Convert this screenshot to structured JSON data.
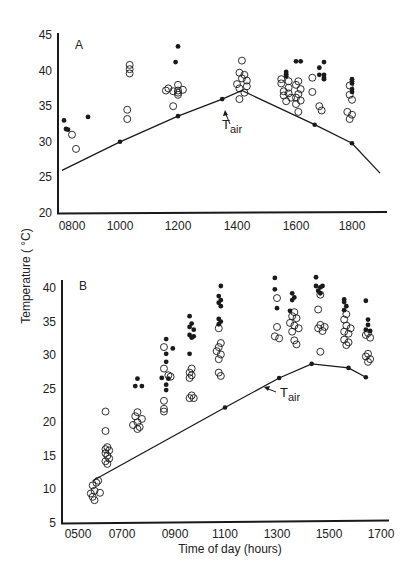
{
  "figure": {
    "ylabel": "Temperature ( °C)",
    "xlabel": "Time of day (hours)"
  },
  "chart_data": [
    {
      "type": "scatter",
      "panel": "A",
      "xlabel": "",
      "ylabel": "Temperature ( °C)",
      "ylim": [
        20,
        45
      ],
      "xlim": [
        730,
        1900
      ],
      "yticks": [
        20,
        25,
        30,
        35,
        40,
        45
      ],
      "xticks": [
        "0800",
        "1000",
        "1200",
        "1400",
        "1600",
        "1800"
      ],
      "grid": false,
      "annotation": "Tair",
      "series": [
        {
          "name": "Tair",
          "style": "line-with-dots",
          "points": [
            [
              735,
              26.0
            ],
            [
              1000,
              30.0,
              "dot"
            ],
            [
              1200,
              33.6,
              "dot"
            ],
            [
              1330,
              36.0,
              "dot"
            ],
            [
              1410,
              37.2
            ],
            [
              1640,
              32.4,
              "dot"
            ],
            [
              1760,
              29.8,
              "dot"
            ],
            [
              1860,
              25.6
            ]
          ]
        },
        {
          "name": "filled",
          "marker": "filled-circle",
          "points": [
            [
              740,
              33.0
            ],
            [
              745,
              31.8
            ],
            [
              750,
              31.7
            ],
            [
              840,
              33.5
            ],
            [
              1160,
              43.4
            ],
            [
              1155,
              41.2
            ],
            [
              1540,
              39.8
            ],
            [
              1540,
              39.5
            ],
            [
              1540,
              39.2
            ],
            [
              1600,
              41.3
            ],
            [
              1610,
              41.3
            ],
            [
              1650,
              40.4
            ],
            [
              1650,
              39.4
            ],
            [
              1700,
              41.2
            ],
            [
              1700,
              39.4
            ],
            [
              1700,
              39.0
            ],
            [
              1700,
              38.8
            ],
            [
              1760,
              38.8
            ],
            [
              1760,
              38.5
            ],
            [
              1760,
              38.2
            ],
            [
              1760,
              37.4
            ],
            [
              1760,
              37.0
            ]
          ]
        },
        {
          "name": "open",
          "marker": "open-circle",
          "points": [
            [
              760,
              31.0
            ],
            [
              770,
              29.0
            ],
            [
              1020,
              40.8
            ],
            [
              1020,
              40.2
            ],
            [
              1020,
              39.6
            ],
            [
              1015,
              34.5
            ],
            [
              1015,
              33.2
            ],
            [
              1160,
              38.0
            ],
            [
              1140,
              37.5
            ],
            [
              1150,
              37.1
            ],
            [
              1135,
              37.2
            ],
            [
              1160,
              36.9
            ],
            [
              1170,
              37.3
            ],
            [
              1150,
              35.0
            ],
            [
              1200,
              37.2
            ],
            [
              1200,
              36.6
            ],
            [
              1410,
              41.4
            ],
            [
              1405,
              39.7
            ],
            [
              1415,
              39.4
            ],
            [
              1410,
              38.9
            ],
            [
              1420,
              38.6
            ],
            [
              1400,
              38.1
            ],
            [
              1420,
              37.8
            ],
            [
              1405,
              37.5
            ],
            [
              1415,
              36.9
            ],
            [
              1405,
              36.0
            ],
            [
              1530,
              38.8
            ],
            [
              1545,
              38.5
            ],
            [
              1530,
              38.2
            ],
            [
              1545,
              37.6
            ],
            [
              1535,
              37.1
            ],
            [
              1545,
              36.8
            ],
            [
              1535,
              36.5
            ],
            [
              1550,
              36.2
            ],
            [
              1540,
              35.7
            ],
            [
              1595,
              39.0
            ],
            [
              1605,
              38.5
            ],
            [
              1600,
              38.0
            ],
            [
              1610,
              37.4
            ],
            [
              1595,
              37.0
            ],
            [
              1605,
              36.7
            ],
            [
              1600,
              36.2
            ],
            [
              1610,
              35.8
            ],
            [
              1600,
              35.3
            ],
            [
              1605,
              34.2
            ],
            [
              1650,
              35.0
            ],
            [
              1655,
              34.4
            ],
            [
              1755,
              37.9
            ],
            [
              1755,
              36.6
            ],
            [
              1760,
              35.9
            ],
            [
              1750,
              34.2
            ],
            [
              1760,
              33.8
            ],
            [
              1755,
              33.2
            ]
          ]
        }
      ]
    },
    {
      "type": "scatter",
      "panel": "B",
      "xlabel": "Time of day (hours)",
      "ylabel": "Temperature ( °C)",
      "ylim": [
        5,
        41
      ],
      "xlim": [
        430,
        1720
      ],
      "yticks": [
        5,
        10,
        15,
        20,
        25,
        30,
        35,
        40
      ],
      "xticks": [
        "0500",
        "0700",
        "0900",
        "1100",
        "1300",
        "1500",
        "1700"
      ],
      "grid": false,
      "annotation": "Tair",
      "series": [
        {
          "name": "Tair",
          "style": "line-with-dots",
          "points": [
            [
              540,
              11.3
            ],
            [
              1100,
              22.2,
              "dot"
            ],
            [
              1305,
              26.6,
              "dot"
            ],
            [
              1420,
              28.7,
              "dot"
            ],
            [
              1545,
              28.1,
              "dot"
            ],
            [
              1625,
              26.7,
              "dot"
            ]
          ]
        },
        {
          "name": "filled",
          "marker": "filled-circle",
          "points": [
            [
              735,
              26.5
            ],
            [
              730,
              25.4
            ],
            [
              745,
              25.4
            ],
            [
              840,
              32.4
            ],
            [
              855,
              31.0
            ],
            [
              840,
              30.2
            ],
            [
              840,
              29.0
            ],
            [
              830,
              26.6
            ],
            [
              845,
              26.5
            ],
            [
              840,
              25.6
            ],
            [
              840,
              24.8
            ],
            [
              935,
              35.8
            ],
            [
              940,
              34.7
            ],
            [
              935,
              34.2
            ],
            [
              945,
              33.8
            ],
            [
              935,
              33.0
            ],
            [
              940,
              32.6
            ],
            [
              945,
              32.8
            ],
            [
              935,
              30.2
            ],
            [
              1050,
              40.3
            ],
            [
              1045,
              38.8
            ],
            [
              1050,
              38.2
            ],
            [
              1045,
              37.8
            ],
            [
              1050,
              37.3
            ],
            [
              1045,
              35.4
            ],
            [
              1050,
              35.0
            ],
            [
              1045,
              34.6
            ],
            [
              1255,
              41.5
            ],
            [
              1255,
              39.8
            ],
            [
              1260,
              37.0
            ],
            [
              1335,
              39.2
            ],
            [
              1340,
              38.6
            ],
            [
              1335,
              38.2
            ],
            [
              1330,
              36.6
            ],
            [
              1430,
              41.6
            ],
            [
              1430,
              40.3
            ],
            [
              1440,
              40.1
            ],
            [
              1445,
              40.3
            ],
            [
              1435,
              39.6
            ],
            [
              1440,
              39.2
            ],
            [
              1535,
              38.3
            ],
            [
              1535,
              37.9
            ],
            [
              1540,
              37.3
            ],
            [
              1535,
              36.7
            ],
            [
              1625,
              38.1
            ],
            [
              1630,
              35.3
            ],
            [
              1630,
              34.5
            ],
            [
              1625,
              33.8
            ],
            [
              1635,
              33.6
            ]
          ]
        },
        {
          "name": "open",
          "marker": "open-circle",
          "points": [
            [
              540,
              10.6
            ],
            [
              545,
              9.8
            ],
            [
              535,
              9.4
            ],
            [
              540,
              8.9
            ],
            [
              545,
              8.4
            ],
            [
              555,
              11.3
            ],
            [
              550,
              11.0
            ],
            [
              560,
              9.5
            ],
            [
              615,
              21.6
            ],
            [
              615,
              18.7
            ],
            [
              620,
              16.3
            ],
            [
              615,
              16.0
            ],
            [
              625,
              15.8
            ],
            [
              615,
              15.4
            ],
            [
              620,
              15.0
            ],
            [
              625,
              14.6
            ],
            [
              615,
              14.2
            ],
            [
              620,
              13.8
            ],
            [
              735,
              21.5
            ],
            [
              730,
              20.9
            ],
            [
              745,
              20.5
            ],
            [
              735,
              20.0
            ],
            [
              725,
              19.6
            ],
            [
              740,
              19.3
            ],
            [
              735,
              19.0
            ],
            [
              835,
              31.2
            ],
            [
              835,
              28.0
            ],
            [
              845,
              27.0
            ],
            [
              850,
              26.8
            ],
            [
              835,
              23.2
            ],
            [
              835,
              22.0
            ],
            [
              835,
              21.6
            ],
            [
              940,
              28.0
            ],
            [
              935,
              27.4
            ],
            [
              940,
              27.0
            ],
            [
              935,
              26.6
            ],
            [
              940,
              24.0
            ],
            [
              935,
              23.6
            ],
            [
              945,
              23.6
            ],
            [
              1045,
              34.0
            ],
            [
              1050,
              31.8
            ],
            [
              1045,
              31.2
            ],
            [
              1040,
              30.6
            ],
            [
              1050,
              30.1
            ],
            [
              1045,
              29.4
            ],
            [
              1045,
              27.4
            ],
            [
              1050,
              26.9
            ],
            [
              1260,
              38.5
            ],
            [
              1260,
              34.2
            ],
            [
              1255,
              32.8
            ],
            [
              1265,
              32.5
            ],
            [
              1340,
              36.4
            ],
            [
              1335,
              35.8
            ],
            [
              1345,
              35.5
            ],
            [
              1330,
              34.8
            ],
            [
              1340,
              34.4
            ],
            [
              1350,
              34.0
            ],
            [
              1335,
              33.5
            ],
            [
              1340,
              32.2
            ],
            [
              1345,
              31.6
            ],
            [
              1440,
              39.0
            ],
            [
              1435,
              36.8
            ],
            [
              1440,
              34.5
            ],
            [
              1450,
              34.2
            ],
            [
              1435,
              34.0
            ],
            [
              1445,
              33.6
            ],
            [
              1440,
              30.5
            ],
            [
              1540,
              36.1
            ],
            [
              1535,
              35.3
            ],
            [
              1540,
              34.4
            ],
            [
              1550,
              34.0
            ],
            [
              1535,
              33.5
            ],
            [
              1545,
              33.2
            ],
            [
              1535,
              32.3
            ],
            [
              1545,
              31.9
            ],
            [
              1540,
              31.5
            ],
            [
              1630,
              33.3
            ],
            [
              1625,
              33.0
            ],
            [
              1635,
              32.6
            ],
            [
              1630,
              30.2
            ],
            [
              1625,
              29.8
            ],
            [
              1635,
              29.4
            ],
            [
              1630,
              29.0
            ]
          ]
        }
      ]
    }
  ],
  "panels": {
    "A": {
      "label": "A",
      "tair_label": "T",
      "tair_sub": "air",
      "yticks": [
        "20",
        "25",
        "30",
        "35",
        "40",
        "45"
      ],
      "xticks": [
        "0800",
        "1000",
        "1200",
        "1400",
        "1600",
        "1800"
      ]
    },
    "B": {
      "label": "B",
      "tair_label": "T",
      "tair_sub": "air",
      "yticks": [
        "5",
        "10",
        "15",
        "20",
        "25",
        "30",
        "35",
        "40"
      ],
      "xticks": [
        "0500",
        "0700",
        "0900",
        "1100",
        "1300",
        "1500",
        "1700"
      ]
    }
  },
  "colors": {
    "ink": "#1a1a1a",
    "background": "#ffffff"
  }
}
